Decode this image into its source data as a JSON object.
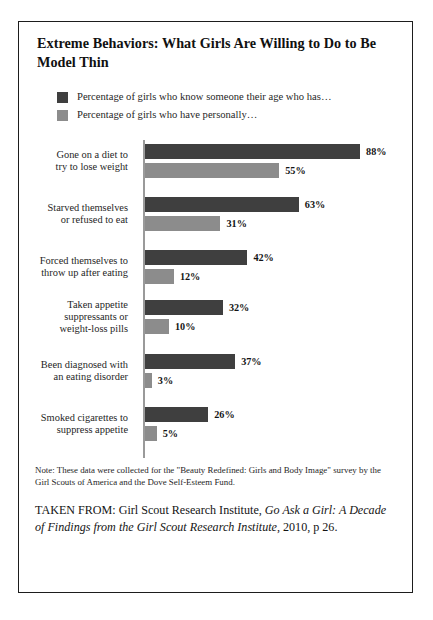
{
  "figure": {
    "title": "Extreme Behaviors: What Girls Are Willing to Do to Be Model Thin",
    "note": "Note: These data were collected for the \"Beauty Redefined: Girls and Body Image\" survey by the Girl Scouts of America and the Dove Self-Esteem Fund.",
    "source": {
      "prefix": "TAKEN FROM: Girl Scout Research Institute,",
      "italic_title": "Go Ask a Girl: A Decade of Findings from the Girl Scout Research Institute",
      "suffix": ", 2010, p 26."
    }
  },
  "colors": {
    "series_known": "#3f3f3f",
    "series_personal": "#8c8c8c",
    "axis": "#9a9a9a",
    "border": "#1d1d1d",
    "text": "#1a1a1a",
    "background": "#ffffff"
  },
  "chart_data": {
    "type": "bar",
    "orientation": "horizontal",
    "title": "Extreme Behaviors: What Girls Are Willing to Do to Be Model Thin",
    "xlabel": "",
    "ylabel": "",
    "xlim": [
      0,
      100
    ],
    "grid": false,
    "legend_position": "top-left",
    "value_suffix": "%",
    "categories": [
      "Gone on a diet to try to lose weight",
      "Starved themselves or refused to eat",
      "Forced themselves to throw up after eating",
      "Taken appetite suppressants or weight-loss pills",
      "Been diagnosed with an eating disorder",
      "Smoked cigarettes to suppress appetite"
    ],
    "category_lines": [
      [
        "Gone on a diet to",
        "try to lose weight"
      ],
      [
        "Starved themselves",
        "or refused to eat"
      ],
      [
        "Forced themselves to",
        "throw up after eating"
      ],
      [
        "Taken appetite",
        "suppressants or",
        "weight-loss pills"
      ],
      [
        "Been diagnosed with",
        "an eating disorder"
      ],
      [
        "Smoked cigarettes to",
        "suppress appetite"
      ]
    ],
    "series": [
      {
        "name": "Percentage of girls who know someone their age who has…",
        "color": "#3f3f3f",
        "values": [
          88,
          63,
          42,
          32,
          37,
          26
        ],
        "labels": [
          "88%",
          "63%",
          "42%",
          "32%",
          "37%",
          "26%"
        ]
      },
      {
        "name": "Percentage of girls who have personally…",
        "color": "#8c8c8c",
        "values": [
          55,
          31,
          12,
          10,
          3,
          5
        ],
        "labels": [
          "55%",
          "31%",
          "12%",
          "10%",
          "3%",
          "5%"
        ]
      }
    ]
  }
}
